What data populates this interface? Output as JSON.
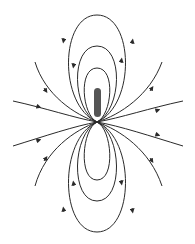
{
  "diagram": {
    "type": "dipole-field-lines",
    "background": "#ffffff",
    "line_color": "#2a2a2a",
    "rod_color": "#555555",
    "rod": {
      "cx": 97,
      "top": 88,
      "bottom": 117,
      "width": 7
    },
    "center": {
      "x": 97,
      "y": 122
    },
    "loops_top": [
      {
        "rx": 12,
        "top": 68
      },
      {
        "rx": 23,
        "top": 46
      },
      {
        "rx": 36,
        "top": 15
      }
    ],
    "loops_bottom": [
      {
        "rx": 12,
        "bottom": 180
      },
      {
        "rx": 23,
        "bottom": 201
      },
      {
        "rx": 36,
        "bottom": 232
      }
    ],
    "arrows": "top loops: up on right side, down on left side; side lines point toward rod on left, away on right",
    "labels": []
  }
}
